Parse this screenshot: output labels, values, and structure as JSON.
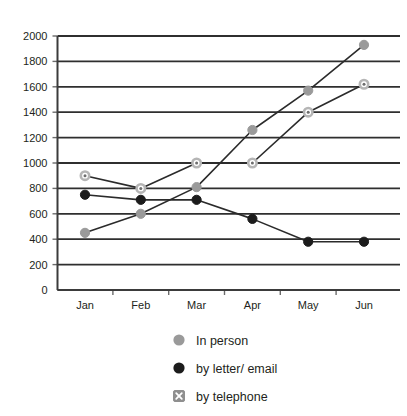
{
  "chart_data": {
    "type": "line",
    "title": "",
    "subtitle": "",
    "xlabel": "",
    "ylabel": "",
    "categories": [
      "Jan",
      "Feb",
      "Mar",
      "Apr",
      "May",
      "Jun"
    ],
    "ylim": [
      0,
      2000
    ],
    "yticks": [
      0,
      200,
      400,
      600,
      800,
      1000,
      1200,
      1400,
      1600,
      1800,
      2000
    ],
    "ytick_labels": [
      "0",
      "200",
      "400",
      "600",
      "800",
      "1000",
      "1200",
      "1400",
      "1600",
      "1800",
      "2000"
    ],
    "grid": true,
    "grid_axis": "y",
    "legend_position": "bottom",
    "series": [
      {
        "name": "In person",
        "marker": "filled-circle",
        "color": "#9a9a9a",
        "values": [
          450,
          600,
          810,
          1260,
          1570,
          1930
        ]
      },
      {
        "name": "by letter/ email",
        "marker": "filled-circle",
        "color": "#1c1c1c",
        "values": [
          750,
          710,
          710,
          560,
          380,
          380
        ]
      },
      {
        "name": "by telephone",
        "marker": "circle-with-x",
        "color": "#b5b5b5",
        "values": [
          900,
          800,
          1000,
          1000,
          1400,
          1620
        ]
      }
    ]
  },
  "legend": {
    "items": [
      {
        "label": "In person",
        "marker": "filled-circle",
        "color": "#9a9a9a"
      },
      {
        "label": "by letter/ email",
        "marker": "filled-circle",
        "color": "#1c1c1c"
      },
      {
        "label": "by telephone",
        "marker": "circle-with-x",
        "color": "#8f8f8f"
      }
    ]
  },
  "colors": {
    "in_person": "#9a9a9a",
    "by_letter_email": "#1c1c1c",
    "by_telephone": "#b5b5b5",
    "axis": "#3b3b3b",
    "grid": "#2f2f2f",
    "text": "#231f20",
    "background": "#ffffff"
  }
}
